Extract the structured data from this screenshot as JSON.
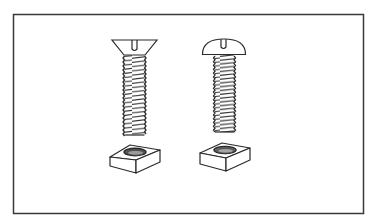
{
  "figure": {
    "type": "line-illustration",
    "frame": {
      "x": 13,
      "y": 14,
      "width": 350,
      "height": 199,
      "stroke": "#3a3a3a"
    },
    "ink_color": "#2a2a2a",
    "background": "#ffffff",
    "items": [
      {
        "name": "flat-head-screw",
        "head": "countersunk flat head, slotted",
        "position": "left"
      },
      {
        "name": "round-head-screw",
        "head": "round dome head, slotted",
        "position": "right"
      },
      {
        "name": "square-nut-left",
        "position": "below left screw"
      },
      {
        "name": "square-nut-right",
        "position": "below right screw"
      }
    ]
  }
}
